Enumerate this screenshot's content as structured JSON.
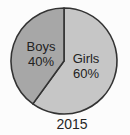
{
  "chart_data": {
    "type": "pie",
    "caption": "2015",
    "categories": [
      "Boys",
      "Girls"
    ],
    "values": [
      40,
      60
    ],
    "unit": "%",
    "start_angle_deg": 0,
    "direction": "clockwise",
    "outline_color": "#333333",
    "legend": "none",
    "slices": [
      {
        "label": "Girls",
        "value": 60,
        "pct_label": "60%",
        "color": "#c6c6c6"
      },
      {
        "label": "Boys",
        "value": 40,
        "pct_label": "40%",
        "color": "#a7a7a7"
      }
    ]
  },
  "labels": {
    "boys": {
      "name": "Boys",
      "pct": "40%"
    },
    "girls": {
      "name": "Girls",
      "pct": "60%"
    },
    "caption": "2015"
  }
}
